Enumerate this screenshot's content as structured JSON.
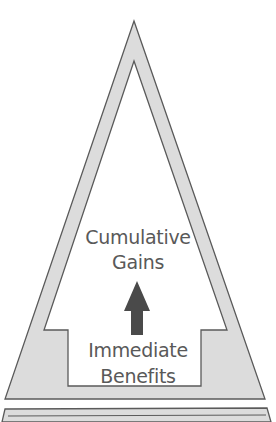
{
  "diagram": {
    "top_labels": [
      "Cumulative",
      "Gains"
    ],
    "bottom_labels": [
      "Immediate",
      "Benefits"
    ],
    "arrow": {
      "direction": "up",
      "color": "#4a4a4a"
    },
    "colors": {
      "band_fill": "#dcdcdc",
      "outline": "#5a5a5a",
      "text": "#595959",
      "background": "#ffffff"
    }
  }
}
